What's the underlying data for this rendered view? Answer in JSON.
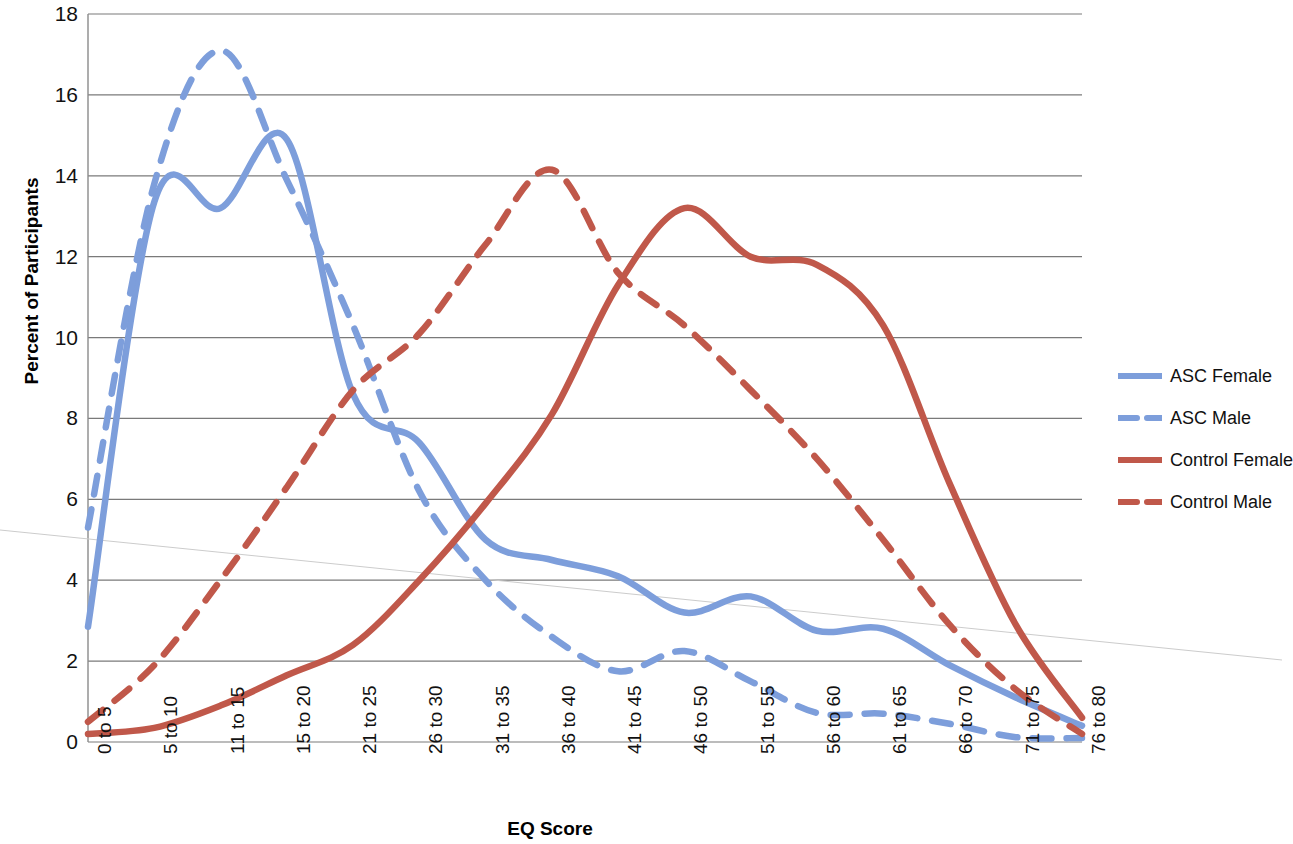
{
  "chart_data": {
    "type": "line",
    "title": "",
    "xlabel": "EQ Score",
    "ylabel": "Percent of Participants",
    "ylim": [
      0,
      18
    ],
    "yticks": [
      0,
      2,
      4,
      6,
      8,
      10,
      12,
      14,
      16,
      18
    ],
    "grid": true,
    "legend_position": "right",
    "categories": [
      "0 to 5",
      "5 to 10",
      "11 to 15",
      "15 to 20",
      "21 to 25",
      "26 to 30",
      "31 to 35",
      "36 to 40",
      "41 to 45",
      "46 to 50",
      "51 to 55",
      "56 to 60",
      "61 to 65",
      "66 to 70",
      "71 to 75",
      "76 to 80"
    ],
    "series": [
      {
        "name": "ASC Female",
        "color": "#7D9EDB",
        "style": "solid",
        "values": [
          2.85,
          13.35,
          13.2,
          14.9,
          8.6,
          7.4,
          5.0,
          4.5,
          4.1,
          3.2,
          3.6,
          2.75,
          2.8,
          1.9,
          1.1,
          0.4
        ]
      },
      {
        "name": "ASC Male",
        "color": "#7D9EDB",
        "style": "dashed",
        "values": [
          5.3,
          13.8,
          17.1,
          13.9,
          10.3,
          6.2,
          4.0,
          2.6,
          1.75,
          2.25,
          1.5,
          0.72,
          0.7,
          0.45,
          0.12,
          0.1
        ]
      },
      {
        "name": "Control Female",
        "color": "#C0584A",
        "style": "solid",
        "values": [
          0.2,
          0.35,
          0.9,
          1.65,
          2.4,
          4.0,
          5.9,
          8.1,
          11.3,
          13.2,
          12.0,
          11.8,
          10.3,
          6.4,
          2.9,
          0.6
        ]
      },
      {
        "name": "Control Male",
        "color": "#C0584A",
        "style": "dashed",
        "values": [
          0.5,
          1.9,
          4.0,
          6.3,
          8.7,
          10.1,
          12.3,
          14.15,
          11.6,
          10.3,
          8.7,
          7.0,
          5.0,
          2.9,
          1.3,
          0.2
        ]
      }
    ]
  },
  "axis": {
    "y_title": "Percent of Participants",
    "x_title": "EQ Score",
    "y_tick_labels": [
      "18",
      "16",
      "14",
      "12",
      "10",
      "8",
      "6",
      "4",
      "2",
      "0"
    ],
    "x_tick_labels": [
      "0 to 5",
      "5 to 10",
      "11 to 15",
      "15 to 20",
      "21 to 25",
      "26 to 30",
      "31 to 35",
      "36 to 40",
      "41 to 45",
      "46 to 50",
      "51 to 55",
      "56 to 60",
      "61 to 65",
      "66 to 70",
      "71 to 75",
      "76 to 80"
    ]
  },
  "legend": {
    "items": [
      {
        "label": "ASC Female",
        "color": "#7D9EDB",
        "style": "solid"
      },
      {
        "label": "ASC Male",
        "color": "#7D9EDB",
        "style": "dashed"
      },
      {
        "label": "Control Female",
        "color": "#C0584A",
        "style": "solid"
      },
      {
        "label": "Control Male",
        "color": "#C0584A",
        "style": "dashed"
      }
    ]
  }
}
